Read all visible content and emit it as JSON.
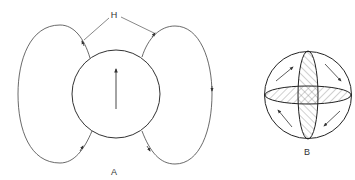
{
  "figure": {
    "panel_a": {
      "label": "A",
      "annotation": "H",
      "description": "Central circle with upward arrow; two closed field-line loops on left and right, with H leader lines"
    },
    "panel_b": {
      "label": "B",
      "description": "Sphere with horizontal and vertical cross-hatched ellipses and four circulating arrows"
    }
  },
  "colors": {
    "stroke": "#333333",
    "hatch": "#777777",
    "background": "#ffffff"
  }
}
